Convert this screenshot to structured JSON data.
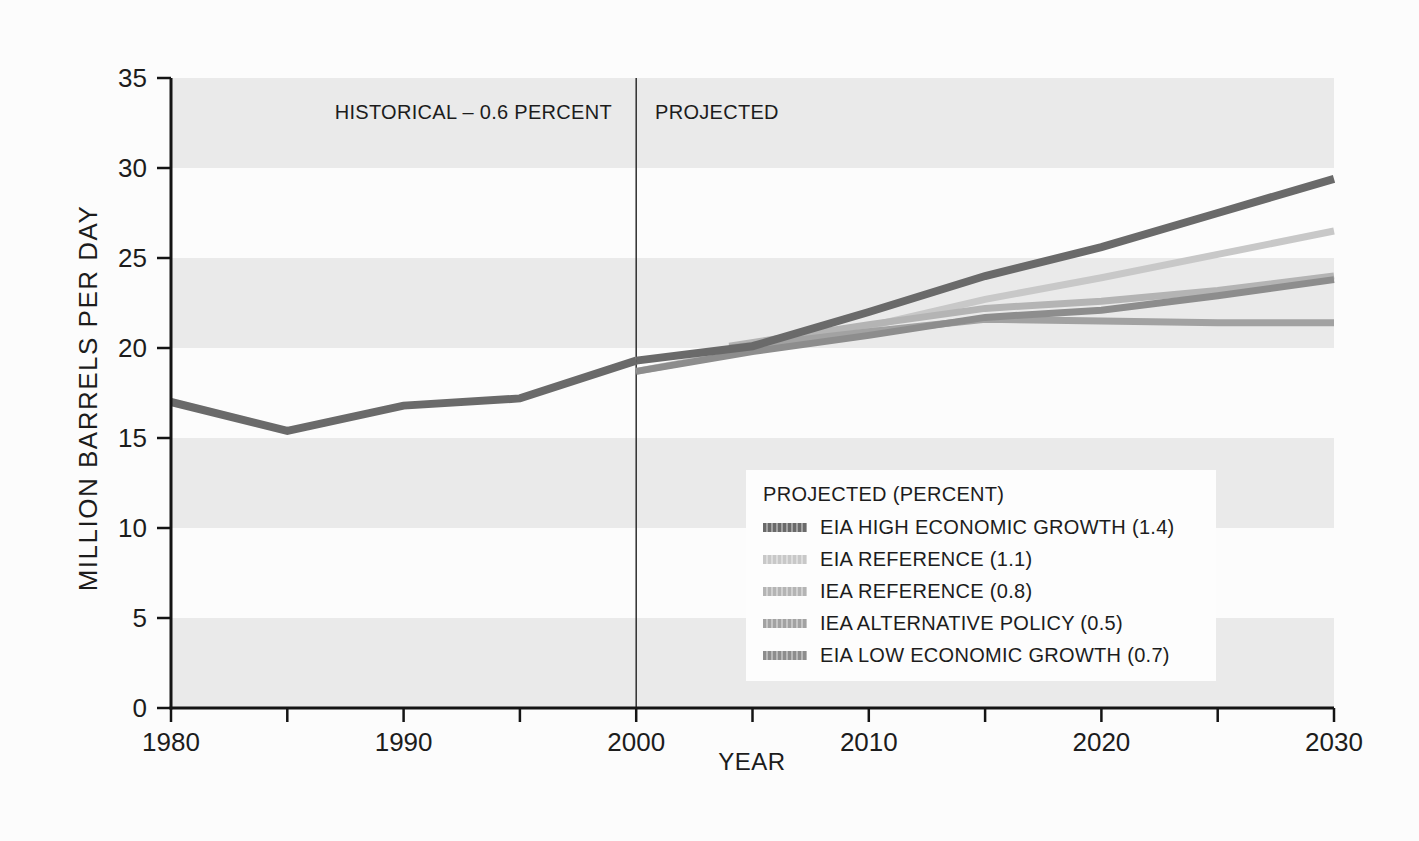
{
  "chart_data": {
    "type": "line",
    "xlabel": "YEAR",
    "ylabel": "MILLION BARRELS PER DAY",
    "xlim": [
      1980,
      2030
    ],
    "ylim": [
      0,
      35
    ],
    "x_ticks_labeled": [
      1980,
      1990,
      2000,
      2010,
      2020,
      2030
    ],
    "x_ticks_minor": [
      1985,
      1995,
      2005,
      2015,
      2025
    ],
    "y_ticks": [
      0,
      5,
      10,
      15,
      20,
      25,
      30,
      35
    ],
    "grid_bands": {
      "ranges": [
        [
          0,
          5
        ],
        [
          10,
          15
        ],
        [
          20,
          25
        ],
        [
          30,
          35
        ]
      ],
      "color": "#eaeaea"
    },
    "divider_year": 2000,
    "divider_color": "#2f2f2f",
    "annotations": {
      "historical": {
        "text": "HISTORICAL – 0.6 PERCENT"
      },
      "projected": {
        "text": "PROJECTED"
      }
    },
    "series": [
      {
        "id": "historical",
        "label": "HISTORICAL – 0.6 PERCENT",
        "show_in_legend": false,
        "color": "#6a6a6a",
        "width": 8,
        "points": [
          [
            1980,
            17.0
          ],
          [
            1985,
            15.4
          ],
          [
            1990,
            16.8
          ],
          [
            1995,
            17.2
          ],
          [
            2000,
            19.3
          ]
        ]
      },
      {
        "id": "eia_high",
        "label": "EIA HIGH ECONOMIC GROWTH (1.4)",
        "show_in_legend": true,
        "color": "#6a6a6a",
        "width": 8,
        "points": [
          [
            2000,
            19.3
          ],
          [
            2005,
            20.1
          ],
          [
            2010,
            22.0
          ],
          [
            2015,
            24.0
          ],
          [
            2020,
            25.6
          ],
          [
            2025,
            27.5
          ],
          [
            2030,
            29.4
          ]
        ]
      },
      {
        "id": "eia_reference",
        "label": "EIA REFERENCE (1.1)",
        "show_in_legend": true,
        "color": "#c8c8c8",
        "width": 7,
        "points": [
          [
            2000,
            18.7
          ],
          [
            2005,
            19.9
          ],
          [
            2010,
            21.2
          ],
          [
            2015,
            22.7
          ],
          [
            2020,
            23.9
          ],
          [
            2025,
            25.2
          ],
          [
            2030,
            26.5
          ]
        ]
      },
      {
        "id": "iea_reference",
        "label": "IEA REFERENCE (0.8)",
        "show_in_legend": true,
        "color": "#b4b4b4",
        "width": 7,
        "points": [
          [
            2004,
            20.1
          ],
          [
            2010,
            21.3
          ],
          [
            2015,
            22.2
          ],
          [
            2020,
            22.6
          ],
          [
            2025,
            23.2
          ],
          [
            2030,
            24.0
          ]
        ]
      },
      {
        "id": "iea_alternative_policy",
        "label": "IEA ALTERNATIVE POLICY (0.5)",
        "show_in_legend": true,
        "color": "#a2a2a2",
        "width": 7,
        "points": [
          [
            2004,
            20.0
          ],
          [
            2010,
            20.9
          ],
          [
            2015,
            21.6
          ],
          [
            2020,
            21.5
          ],
          [
            2025,
            21.4
          ],
          [
            2030,
            21.4
          ]
        ]
      },
      {
        "id": "eia_low",
        "label": "EIA LOW ECONOMIC GROWTH (0.7)",
        "show_in_legend": true,
        "color": "#8d8d8d",
        "width": 7,
        "points": [
          [
            2000,
            18.7
          ],
          [
            2005,
            19.8
          ],
          [
            2010,
            20.7
          ],
          [
            2015,
            21.7
          ],
          [
            2020,
            22.1
          ],
          [
            2025,
            22.9
          ],
          [
            2030,
            23.8
          ]
        ]
      }
    ],
    "draw_order": [
      "eia_reference",
      "iea_reference",
      "iea_alternative_policy",
      "eia_low",
      "eia_high",
      "historical"
    ],
    "legend": {
      "title": "PROJECTED (PERCENT)",
      "position": "lower right",
      "order": [
        "eia_high",
        "eia_reference",
        "iea_reference",
        "iea_alternative_policy",
        "eia_low"
      ]
    }
  }
}
